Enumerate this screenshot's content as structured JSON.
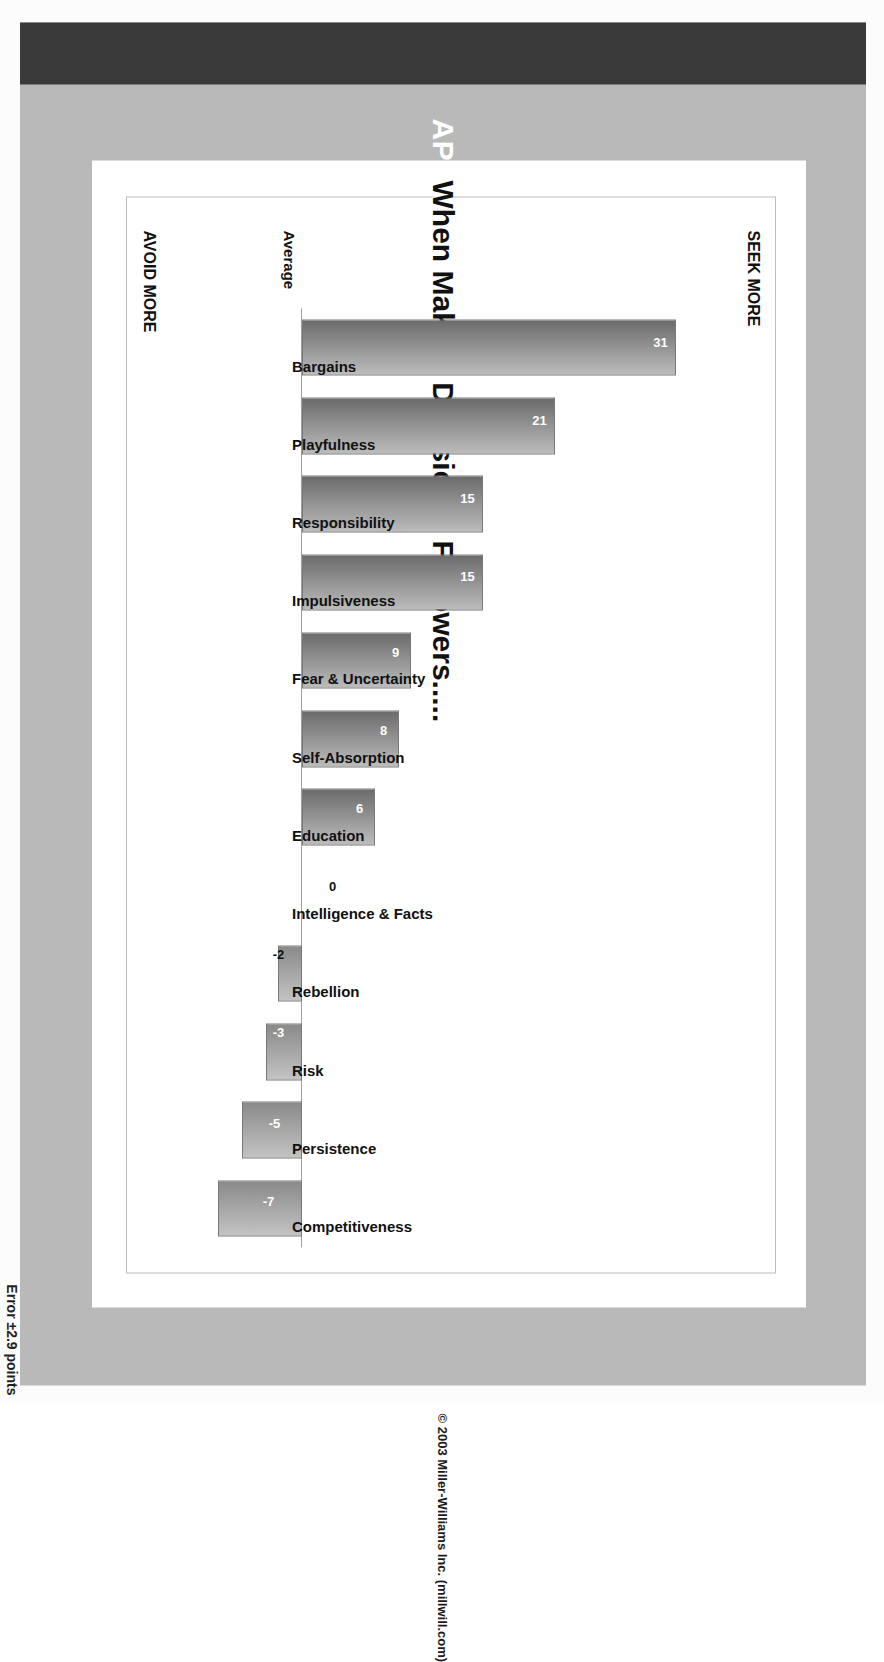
{
  "slide": {
    "title": "APPROACH PROFILE for FOLLOWERS",
    "subtitle": "When Making Decisions, Followers.....",
    "copyright": "© 2003 Miller-Williams Inc.  (millwill.com)",
    "error_note": "Error ±2.9 points"
  },
  "chart_data": {
    "type": "bar",
    "title": "When Making Decisions, Followers.....",
    "xlabel": "",
    "ylabel": "Average",
    "axis_title": "Average",
    "top_axis_label": "SEEK MORE",
    "bottom_axis_label": "AVOID MORE",
    "zero_label": "0",
    "ylim": [
      -10,
      35
    ],
    "grid": false,
    "legend": "none",
    "categories": [
      "Bargains",
      "Playfulness",
      "Responsibility",
      "Impulsiveness",
      "Fear & Uncertainty",
      "Self-Absorption",
      "Education",
      "Intelligence & Facts",
      "Rebellion",
      "Risk",
      "Persistence",
      "Competitiveness"
    ],
    "values": [
      31,
      21,
      15,
      15,
      9,
      8,
      6,
      0,
      -2,
      -3,
      -5,
      -7
    ],
    "value_labels": [
      "31",
      "21",
      "15",
      "15",
      "9",
      "8",
      "6",
      "0",
      "-2",
      "-3",
      "-5",
      "-7"
    ],
    "annotations": [
      "Error ±2.9 points"
    ]
  }
}
